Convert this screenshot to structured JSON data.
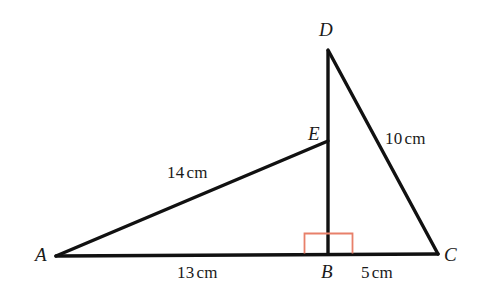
{
  "figure": {
    "type": "geometry-diagram",
    "background_color": "#ffffff",
    "stroke_color": "#111111",
    "right_angle_color": "#e8806a",
    "canvas": {
      "width": 478,
      "height": 299
    },
    "vertices": [
      {
        "name": "A",
        "label": "A",
        "x": 56,
        "y": 256,
        "label_pos": "left"
      },
      {
        "name": "B",
        "label": "B",
        "x": 328,
        "y": 253,
        "label_pos": "below"
      },
      {
        "name": "C",
        "label": "C",
        "x": 438,
        "y": 254,
        "label_pos": "right"
      },
      {
        "name": "D",
        "label": "D",
        "x": 328,
        "y": 50,
        "label_pos": "above"
      },
      {
        "name": "E",
        "label": "E",
        "x": 328,
        "y": 141,
        "label_pos": "left"
      }
    ],
    "segments": [
      {
        "name": "AC",
        "from": "A",
        "to": "C",
        "style": "solid"
      },
      {
        "name": "DB",
        "from": "D",
        "to": "B",
        "style": "solid"
      },
      {
        "name": "DC",
        "from": "D",
        "to": "C",
        "style": "solid"
      },
      {
        "name": "AE",
        "from": "A",
        "to": "E",
        "style": "solid"
      }
    ],
    "measurements": [
      {
        "name": "AE",
        "segment": "AE",
        "value": "14",
        "unit": "cm"
      },
      {
        "name": "DC",
        "segment": "DC",
        "value": "10",
        "unit": "cm"
      },
      {
        "name": "AB",
        "segment": "AB",
        "value": "13",
        "unit": "cm"
      },
      {
        "name": "BC",
        "segment": "BC",
        "value": "5",
        "unit": "cm"
      }
    ],
    "right_angle": {
      "at_vertex": "B",
      "between": [
        "AC",
        "DB"
      ],
      "color": "#e8806a",
      "box": {
        "x": 304,
        "y": 233,
        "width": 49,
        "height": 20
      }
    }
  }
}
